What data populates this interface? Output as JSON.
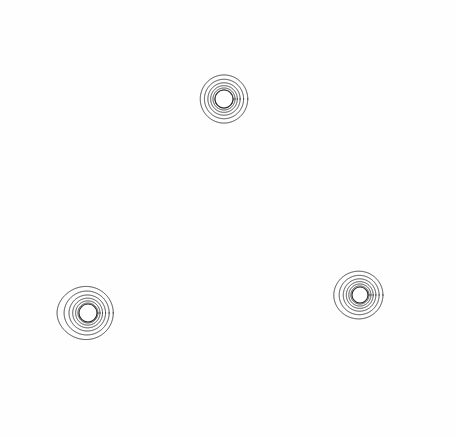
{
  "figure": {
    "background_color": "#fefefe",
    "line_color": "#2b2b2b",
    "line_width": 0.9,
    "width": 456,
    "height": 437
  },
  "chart_data": {
    "type": "line",
    "subtitle": "",
    "xlabel": "",
    "ylabel": "",
    "xlim": [
      0,
      456
    ],
    "ylim": [
      0,
      437
    ],
    "grid": false,
    "legend": "none",
    "axes_visible": false,
    "tick_labels": [],
    "annotations": [],
    "series": [
      {
        "name": "top-contour-set",
        "source_center": [
          224,
          99
        ],
        "source_radius": 9,
        "cusp_points": [
          [
            224,
            33
          ],
          [
            224,
            163
          ]
        ],
        "cusp_count": 2,
        "orientation": "vertical-cusps",
        "contour_count": 20,
        "bbox": [
          112,
          26,
          337,
          173
        ],
        "levels": [
          0.055,
          0.064,
          0.075,
          0.088,
          0.104,
          0.124,
          0.148,
          0.178,
          0.215,
          0.262,
          0.32,
          0.395,
          0.49,
          0.61,
          0.77,
          0.98,
          1.27,
          1.67,
          2.25,
          3.1
        ]
      },
      {
        "name": "bottom-left-contour-set",
        "source_center": [
          88,
          313
        ],
        "source_radius": 9,
        "cusp_points": [
          [
            50,
            313
          ]
        ],
        "cusp_count": 1,
        "orientation": "left-cusp",
        "contour_count": 20,
        "bbox": [
          18,
          204,
          207,
          426
        ],
        "levels": [
          0.048,
          0.056,
          0.066,
          0.078,
          0.093,
          0.111,
          0.133,
          0.161,
          0.196,
          0.24,
          0.296,
          0.368,
          0.46,
          0.58,
          0.74,
          0.95,
          1.24,
          1.64,
          2.22,
          3.08
        ]
      },
      {
        "name": "bottom-right-contour-set",
        "source_center": [
          360,
          295
        ],
        "source_radius": 8,
        "cusp_points": [
          [
            311,
            296
          ]
        ],
        "cusp_count": 1,
        "orientation": "left-cusp",
        "contour_count": 20,
        "bbox": [
          283,
          196,
          447,
          408
        ],
        "levels": [
          0.052,
          0.061,
          0.072,
          0.085,
          0.101,
          0.121,
          0.145,
          0.175,
          0.213,
          0.261,
          0.322,
          0.4,
          0.5,
          0.63,
          0.8,
          1.03,
          1.35,
          1.79,
          2.42,
          3.35
        ]
      }
    ]
  }
}
